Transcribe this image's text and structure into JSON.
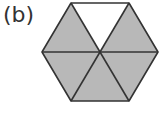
{
  "figure": {
    "label": "(b)",
    "shape": "regular hexagon divided into 6 equilateral triangles",
    "total_parts": 6,
    "shaded_parts": 5,
    "unshaded_parts": [
      "top"
    ],
    "colors": {
      "shaded": "#b8b8b8",
      "unshaded": "#ffffff",
      "stroke": "#333333"
    }
  }
}
